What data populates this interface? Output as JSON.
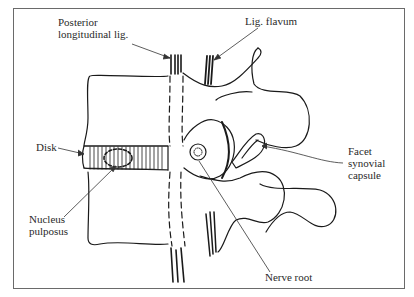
{
  "figure": {
    "type": "anatomical-diagram",
    "labels": {
      "posterior_longitudinal_lig_line1": "Posterior",
      "posterior_longitudinal_lig_line2": "longitudinal lig.",
      "lig_flavum": "Lig. flavum",
      "disk": "Disk",
      "nucleus_pulposus_line1": "Nucleus",
      "nucleus_pulposus_line2": "pulposus",
      "facet_line1": "Facet",
      "facet_line2": "synovial",
      "facet_line3": "capsule",
      "nerve_root": "Nerve root"
    },
    "caption_partial": "(caption text clipped at bottom edge)",
    "colors": {
      "ink": "#1a1a1a",
      "frame": "#6a6a6a",
      "background": "#ffffff"
    }
  }
}
